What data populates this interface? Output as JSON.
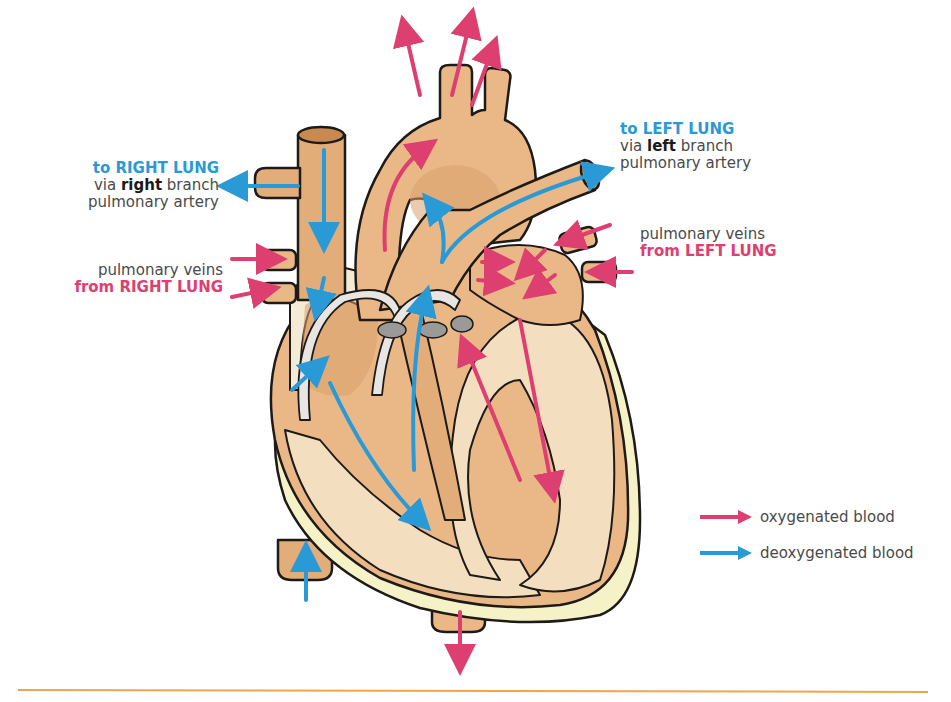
{
  "labels": {
    "right_lung_out": {
      "title": "to RIGHT LUNG",
      "line2_pre": "via ",
      "line2_bold": "right",
      "line2_post": " branch",
      "line3": "pulmonary artery"
    },
    "left_lung_out": {
      "title": "to LEFT LUNG",
      "line2_pre": "via ",
      "line2_bold": "left",
      "line2_post": " branch",
      "line3": "pulmonary artery"
    },
    "right_lung_in": {
      "line1": "pulmonary veins",
      "title": "from RIGHT LUNG"
    },
    "left_lung_in": {
      "line1": "pulmonary veins",
      "title": "from LEFT LUNG"
    }
  },
  "legend": [
    {
      "label": "oxygenated blood",
      "icon": "pink-arrow-icon",
      "color": "#dd3f70"
    },
    {
      "label": "deoxygenated blood",
      "icon": "blue-arrow-icon",
      "color": "#2a9ad6"
    }
  ],
  "colors": {
    "oxygenated": "#dd3f70",
    "deoxygenated": "#2a9ad6",
    "tissue": "#eab886",
    "tissue_dark": "#d9a06d",
    "muscle": "#f3dfc0",
    "pericardium": "#f6f2c8",
    "outline": "#1e1a18",
    "rule": "#f0a54d"
  }
}
